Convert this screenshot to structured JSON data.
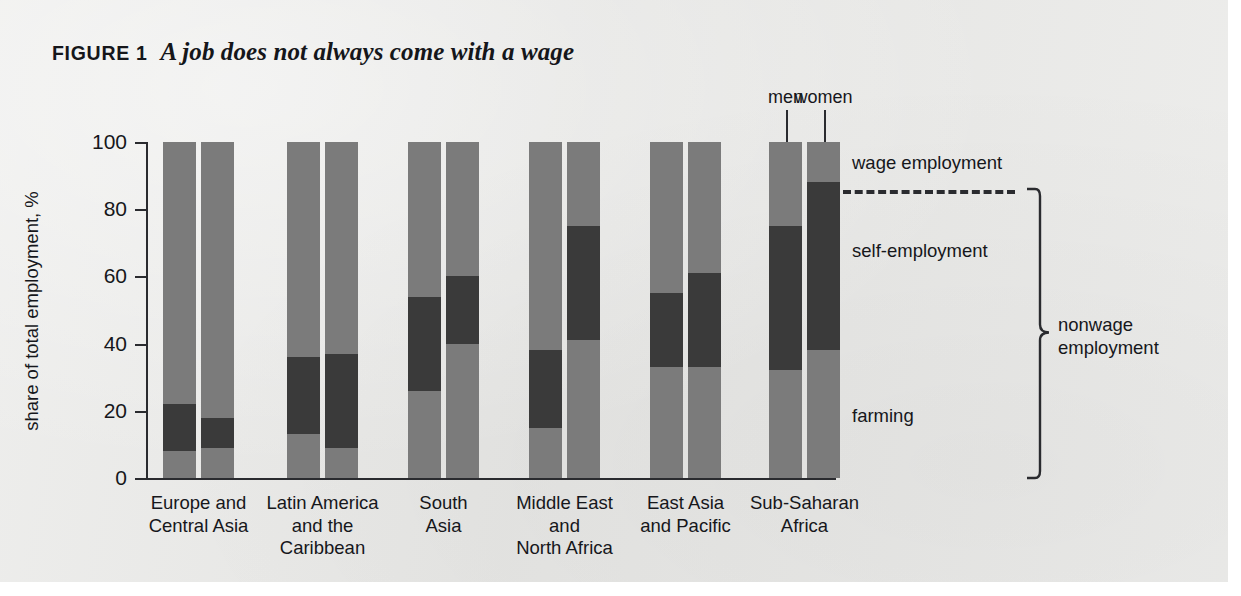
{
  "figure": {
    "label": "FIGURE 1",
    "title": "A job does not always come with a wage"
  },
  "colors": {
    "background": "#e9e9e7",
    "wage_employment": "#7b7b7b",
    "self_employment": "#3a3a3a",
    "farming": "#7b7b7b",
    "axis": "#2a2b2f",
    "text": "#16171b"
  },
  "legend": {
    "wage": "wage employment",
    "self": "self-employment",
    "farming": "farming",
    "nonwage_line1": "nonwage",
    "nonwage_line2": "employment"
  },
  "series_labels": {
    "men": "men",
    "women": "women"
  },
  "chart_data": {
    "type": "bar",
    "title": "A job does not always come with a wage",
    "subtitle": "",
    "xlabel": "",
    "ylabel": "share of total employment, %",
    "ylim": [
      0,
      100
    ],
    "yticks": [
      0,
      20,
      40,
      60,
      80,
      100
    ],
    "ytick_labels": [
      "0",
      "20",
      "40",
      "60",
      "80",
      "100"
    ],
    "grid": false,
    "legend_position": "right",
    "stacked": true,
    "stack_order_bottom_to_top": [
      "farming",
      "self-employment",
      "wage employment"
    ],
    "categories": [
      "Europe and Central Asia",
      "Latin America and the Caribbean",
      "South Asia",
      "Middle East and North Africa",
      "East Asia and Pacific",
      "Sub-Saharan Africa"
    ],
    "category_label_lines": [
      [
        "Europe and",
        "Central Asia"
      ],
      [
        "Latin America",
        "and the",
        "Caribbean"
      ],
      [
        "South",
        "Asia"
      ],
      [
        "Middle East",
        "and",
        "North Africa"
      ],
      [
        "East Asia",
        "and Pacific"
      ],
      [
        "Sub-Saharan",
        "Africa"
      ]
    ],
    "groups": [
      "men",
      "women"
    ],
    "series": [
      {
        "name": "farming",
        "values_men": [
          8,
          13,
          26,
          15,
          33,
          32
        ],
        "values_women": [
          9,
          9,
          40,
          41,
          33,
          38
        ]
      },
      {
        "name": "self-employment",
        "values_men": [
          14,
          23,
          28,
          23,
          22,
          43
        ],
        "values_women": [
          9,
          28,
          20,
          34,
          28,
          50
        ]
      },
      {
        "name": "wage employment",
        "values_men": [
          78,
          64,
          46,
          62,
          45,
          25
        ],
        "values_women": [
          82,
          63,
          40,
          25,
          39,
          12
        ]
      }
    ],
    "cumulative_tops": {
      "farming_men": [
        8,
        13,
        26,
        15,
        33,
        32
      ],
      "farming_women": [
        9,
        9,
        40,
        41,
        33,
        38
      ],
      "nonwage_men": [
        22,
        36,
        54,
        38,
        55,
        75
      ],
      "nonwage_women": [
        18,
        37,
        60,
        75,
        61,
        88
      ]
    }
  }
}
